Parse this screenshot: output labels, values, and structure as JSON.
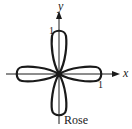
{
  "figure": {
    "type": "polar-rose",
    "caption": "Rose",
    "axes": {
      "x_label": "x",
      "y_label": "y",
      "x_tick": "1",
      "y_tick": "1"
    },
    "petals": 4,
    "colors": {
      "stroke": "#1a1a1a",
      "background": "#ffffff"
    }
  }
}
